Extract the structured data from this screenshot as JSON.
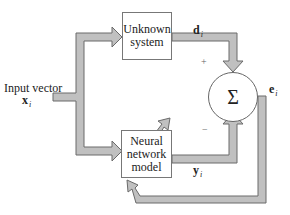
{
  "diagram": {
    "input": {
      "label": "Input vector",
      "symbol": "x",
      "subscript": "i"
    },
    "unknown_system": {
      "line1": "Unknown",
      "line2": "system"
    },
    "neural_network": {
      "line1": "Neural",
      "line2": "network",
      "line3": "model"
    },
    "summer": {
      "symbol": "Σ",
      "plus": "+",
      "minus": "−"
    },
    "desired": {
      "symbol": "d",
      "subscript": "i"
    },
    "output": {
      "symbol": "y",
      "subscript": "i"
    },
    "error": {
      "symbol": "e",
      "subscript": "i"
    },
    "colors": {
      "arrow_fill": "#c0c0c0",
      "arrow_stroke": "#6a6a6a",
      "box_border": "#777777"
    }
  }
}
